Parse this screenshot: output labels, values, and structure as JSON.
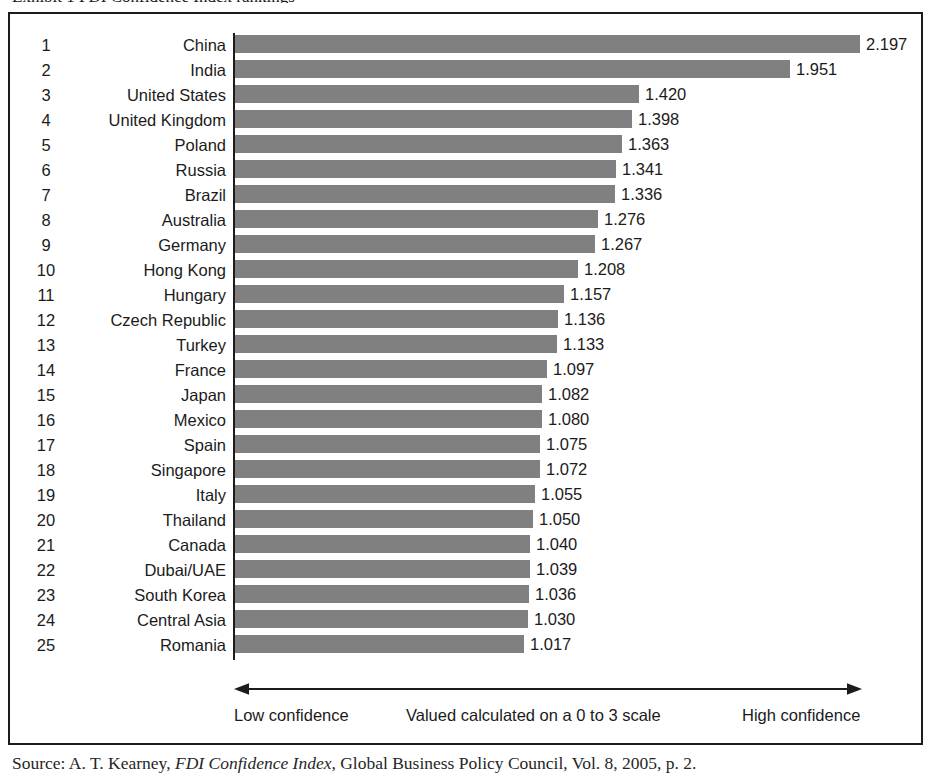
{
  "figure": {
    "title_fragment": "Exhibit 1   FDI Confidence Index rankings",
    "source_prefix": "Source: A. T. Kearney, ",
    "source_italic": "FDI Confidence Index",
    "source_suffix": ", Global Business Policy Council, Vol. 8, 2005, p. 2."
  },
  "axis": {
    "low_label": "Low confidence",
    "mid_label": "Valued calculated on a 0 to 3 scale",
    "high_label": "High confidence",
    "arrow_left_name": "left-arrowhead",
    "arrow_right_name": "right-arrowhead"
  },
  "colors": {
    "bar": "#808080",
    "frame": "#1c1c1c",
    "text": "#1b1b1b",
    "background": "#ffffff"
  },
  "chart_data": {
    "type": "bar",
    "orientation": "horizontal",
    "title": "FDI Confidence Index rankings",
    "xlabel": "Valued calculated on a 0 to 3 scale",
    "ylabel": "",
    "xlim": [
      0,
      2.2
    ],
    "grid": false,
    "legend": "none",
    "value_format": "0.000",
    "ranks": [
      1,
      2,
      3,
      4,
      5,
      6,
      7,
      8,
      9,
      10,
      11,
      12,
      13,
      14,
      15,
      16,
      17,
      18,
      19,
      20,
      21,
      22,
      23,
      24,
      25
    ],
    "categories": [
      "China",
      "India",
      "United States",
      "United Kingdom",
      "Poland",
      "Russia",
      "Brazil",
      "Australia",
      "Germany",
      "Hong Kong",
      "Hungary",
      "Czech Republic",
      "Turkey",
      "France",
      "Japan",
      "Mexico",
      "Spain",
      "Singapore",
      "Italy",
      "Thailand",
      "Canada",
      "Dubai/UAE",
      "South Korea",
      "Central Asia",
      "Romania"
    ],
    "values": [
      2.197,
      1.951,
      1.42,
      1.398,
      1.363,
      1.341,
      1.336,
      1.276,
      1.267,
      1.208,
      1.157,
      1.136,
      1.133,
      1.097,
      1.082,
      1.08,
      1.075,
      1.072,
      1.055,
      1.05,
      1.04,
      1.039,
      1.036,
      1.03,
      1.017
    ],
    "value_labels": [
      "2.197",
      "1.951",
      "1.420",
      "1.398",
      "1.363",
      "1.341",
      "1.336",
      "1.276",
      "1.267",
      "1.208",
      "1.157",
      "1.136",
      "1.133",
      "1.097",
      "1.082",
      "1.080",
      "1.075",
      "1.072",
      "1.055",
      "1.050",
      "1.040",
      "1.039",
      "1.036",
      "1.030",
      "1.017"
    ]
  }
}
